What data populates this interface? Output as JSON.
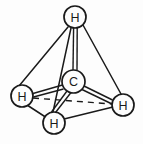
{
  "figure": {
    "background_color": "#fdfdfd",
    "line_color": "#1a1a1a",
    "label_color": "#1a1a1a"
  },
  "atoms": [
    {
      "id": "h-top",
      "label": "H",
      "cx": 75,
      "cy": 17,
      "r": 11,
      "role": "hydrogen",
      "position": "top-apex"
    },
    {
      "id": "c-center",
      "label": "C",
      "cx": 73.5,
      "cy": 81.5,
      "r": 11.5,
      "role": "carbon",
      "position": "center"
    },
    {
      "id": "h-left",
      "label": "H",
      "cx": 22,
      "cy": 96,
      "r": 11,
      "role": "hydrogen",
      "position": "left-vertex"
    },
    {
      "id": "h-right",
      "label": "H",
      "cx": 123,
      "cy": 105,
      "r": 11,
      "role": "hydrogen",
      "position": "right-vertex"
    },
    {
      "id": "h-bottom",
      "label": "H",
      "cx": 54,
      "cy": 123,
      "r": 11,
      "role": "hydrogen",
      "position": "bottom-vertex"
    }
  ],
  "tetrahedron_edges": [
    {
      "id": "edge-top-left",
      "from": "h-top",
      "to": "h-left",
      "style": "solid"
    },
    {
      "id": "edge-top-bottom",
      "from": "h-top",
      "to": "h-bottom",
      "style": "solid"
    },
    {
      "id": "edge-top-right",
      "from": "h-top",
      "to": "h-right",
      "style": "solid"
    },
    {
      "id": "edge-left-bottom",
      "from": "h-left",
      "to": "h-bottom",
      "style": "solid"
    },
    {
      "id": "edge-bottom-right",
      "from": "h-bottom",
      "to": "h-right",
      "style": "solid"
    },
    {
      "id": "edge-left-right",
      "from": "h-left",
      "to": "h-right",
      "style": "dashed"
    }
  ],
  "bonds": [
    {
      "id": "bond-c-h-top",
      "from": "c-center",
      "to": "h-top",
      "style": "double-outline"
    },
    {
      "id": "bond-c-h-left",
      "from": "c-center",
      "to": "h-left",
      "style": "double-outline"
    },
    {
      "id": "bond-c-h-right",
      "from": "c-center",
      "to": "h-right",
      "style": "double-outline"
    },
    {
      "id": "bond-c-h-bottom",
      "from": "c-center",
      "to": "h-bottom",
      "style": "double-outline"
    }
  ]
}
